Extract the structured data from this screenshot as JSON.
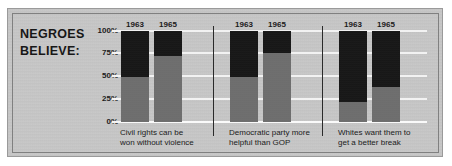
{
  "title": {
    "line1": "NEGROES",
    "line2": "BELIEVE:"
  },
  "chart_data": {
    "type": "bar",
    "subtype": "stacked-percentage",
    "title": "NEGROES BELIEVE:",
    "xlabel": "",
    "ylabel": "",
    "ylim": [
      0,
      100
    ],
    "yticks": [
      "0%",
      "25%",
      "50%",
      "75%",
      "100%"
    ],
    "ytick_values": [
      0,
      25,
      50,
      75,
      100
    ],
    "grid": true,
    "legend_position": "none",
    "categories": [
      "Civil rights can be won without violence",
      "Democratic party more helpful than GOP",
      "Whites want them to get a better break"
    ],
    "series": [
      {
        "name": "1963",
        "segment_label": "agree",
        "color": "#6f6f6f",
        "values": [
          50,
          49,
          22
        ]
      },
      {
        "name": "1963-upper",
        "segment_label": "remainder",
        "color": "#161616",
        "values": [
          50,
          51,
          78
        ]
      },
      {
        "name": "1965",
        "segment_label": "agree",
        "color": "#6f6f6f",
        "values": [
          73,
          76,
          38
        ]
      },
      {
        "name": "1965-upper",
        "segment_label": "remainder",
        "color": "#161616",
        "values": [
          27,
          24,
          62
        ]
      }
    ],
    "groups": [
      {
        "caption_line1": "Civil rights can be",
        "caption_line2": "won without violence",
        "bars": [
          {
            "year": "1963",
            "lower_pct": 50,
            "upper_pct": 50
          },
          {
            "year": "1965",
            "lower_pct": 73,
            "upper_pct": 27
          }
        ]
      },
      {
        "caption_line1": "Democratic party more",
        "caption_line2": "helpful than GOP",
        "bars": [
          {
            "year": "1963",
            "lower_pct": 49,
            "upper_pct": 51
          },
          {
            "year": "1965",
            "lower_pct": 76,
            "upper_pct": 24
          }
        ]
      },
      {
        "caption_line1": "Whites want them to",
        "caption_line2": "get a better break",
        "bars": [
          {
            "year": "1963",
            "lower_pct": 22,
            "upper_pct": 78
          },
          {
            "year": "1965",
            "lower_pct": 38,
            "upper_pct": 62
          }
        ]
      }
    ]
  },
  "colors": {
    "plate_background": "#c8c8c8",
    "bar_lower": "#6f6f6f",
    "bar_upper": "#161616",
    "gridline": "#f2f2f2",
    "separator": "#2a2a2a",
    "text": "#1b1b1b"
  }
}
